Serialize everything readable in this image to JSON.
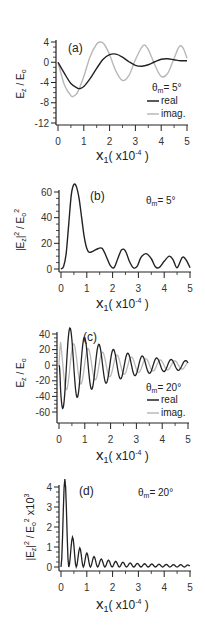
{
  "chart_data": [
    {
      "id": "a",
      "type": "line",
      "panel_label": "(a)",
      "annotation": "θm = 5°",
      "theta_m": "5°",
      "ylabel": "Ez / Eo",
      "xlabel": "x1 ( x10^-4 )",
      "xlim": [
        0,
        5
      ],
      "ylim": [
        -12,
        4
      ],
      "xticks": [
        0,
        1,
        2,
        3,
        4,
        5
      ],
      "yticks": [
        4,
        0,
        -4,
        -8,
        -12
      ],
      "legend": [
        "real",
        "imag."
      ],
      "series": [
        {
          "name": "real",
          "color": "#222222",
          "x": [
            0,
            0.25,
            0.5,
            0.75,
            0.85,
            1.0,
            1.25,
            1.5,
            1.75,
            2.0,
            2.25,
            2.5,
            2.75,
            3.0,
            3.25,
            3.5,
            3.75,
            4.0,
            4.25,
            4.5,
            4.75,
            5.0
          ],
          "y": [
            0,
            -2.2,
            -4.2,
            -5.1,
            -5.2,
            -4.8,
            -3.2,
            -1.2,
            0.6,
            1.5,
            1.6,
            1.0,
            0.1,
            -0.6,
            -0.8,
            -0.5,
            0.1,
            0.6,
            0.7,
            0.5,
            0.3,
            0.3
          ]
        },
        {
          "name": "imag.",
          "color": "#b8b8b8",
          "x": [
            0,
            0.25,
            0.5,
            0.6,
            0.75,
            1.0,
            1.25,
            1.5,
            1.65,
            1.8,
            2.0,
            2.25,
            2.5,
            2.75,
            3.0,
            3.3,
            3.5,
            3.75,
            4.0,
            4.25,
            4.5,
            4.7,
            4.85,
            5.0
          ],
          "y": [
            0,
            -4.5,
            -6.6,
            -6.7,
            -6.0,
            -2.8,
            1.2,
            3.6,
            4.0,
            3.5,
            1.5,
            -1.8,
            -3.6,
            -2.6,
            0.5,
            3.3,
            2.5,
            -0.5,
            -2.8,
            -2.2,
            0.8,
            3.1,
            2.8,
            0.8
          ]
        }
      ]
    },
    {
      "id": "b",
      "type": "line",
      "panel_label": "(b)",
      "annotation": "θm = 5°",
      "theta_m": "5°",
      "ylabel": "|Ez|^2 / Eo^2",
      "xlabel": "x1 ( x10^-4 )",
      "xlim": [
        0,
        5
      ],
      "ylim": [
        0,
        70
      ],
      "xticks": [
        0,
        1,
        2,
        3,
        4,
        5
      ],
      "yticks": [
        0,
        20,
        40,
        60
      ],
      "series": [
        {
          "name": "|Ez|^2/Eo^2",
          "color": "#222222",
          "x": [
            0,
            0.1,
            0.2,
            0.3,
            0.4,
            0.5,
            0.6,
            0.7,
            0.8,
            0.9,
            1.0,
            1.1,
            1.25,
            1.45,
            1.6,
            1.75,
            1.9,
            2.05,
            2.2,
            2.35,
            2.5,
            2.65,
            2.8,
            2.95,
            3.1,
            3.3,
            3.5,
            3.65,
            3.8,
            4.0,
            4.2,
            4.35,
            4.5,
            4.7,
            4.85,
            5.0
          ],
          "y": [
            0,
            2,
            12,
            35,
            58,
            66,
            64,
            55,
            40,
            25,
            16,
            13,
            14,
            16,
            16,
            10,
            3,
            1,
            8,
            15,
            14,
            6,
            1,
            2,
            9,
            12,
            8,
            2,
            1,
            6,
            10,
            7,
            1,
            9,
            7,
            1
          ]
        }
      ]
    },
    {
      "id": "c",
      "type": "line",
      "panel_label": "(c)",
      "annotation": "θm = 20°",
      "theta_m": "20°",
      "ylabel": "Ez / Eo",
      "xlabel": "x1 ( x10^-4 )",
      "xlim": [
        0,
        5
      ],
      "ylim": [
        -70,
        40
      ],
      "xticks": [
        0,
        1,
        2,
        3,
        4,
        5
      ],
      "yticks": [
        40,
        20,
        0,
        -20,
        -40,
        -60
      ],
      "legend": [
        "real",
        "imag."
      ],
      "series": [
        {
          "name": "real",
          "color": "#222222",
          "model": "damped-cosine",
          "amp0": 58,
          "decay": 0.55,
          "period": 0.56,
          "phase_x": 0.15,
          "sign": -1
        },
        {
          "name": "imag.",
          "color": "#b8b8b8",
          "model": "damped-cosine",
          "amp0": 34,
          "decay": 0.5,
          "period": 0.56,
          "phase_x": 0.01,
          "sign": 1
        }
      ]
    },
    {
      "id": "d",
      "type": "line",
      "panel_label": "(d)",
      "annotation": "θm = 20°",
      "theta_m": "20°",
      "ylabel": "|Ez|^2 / Eo^2 x10^3",
      "xlabel": "x1 ( x10^-4 )",
      "xlim": [
        0,
        5
      ],
      "ylim": [
        0,
        4.5
      ],
      "xticks": [
        0,
        1,
        2,
        3,
        4,
        5
      ],
      "yticks": [
        0,
        1,
        2,
        3,
        4
      ],
      "peaks": [
        {
          "x": 0.15,
          "y": 4.4
        },
        {
          "x": 0.45,
          "y": 1.5
        },
        {
          "x": 0.73,
          "y": 0.95
        },
        {
          "x": 1.0,
          "y": 0.7
        },
        {
          "x": 1.28,
          "y": 0.52
        },
        {
          "x": 1.56,
          "y": 0.4
        },
        {
          "x": 1.84,
          "y": 0.34
        },
        {
          "x": 2.12,
          "y": 0.28
        },
        {
          "x": 2.4,
          "y": 0.24
        },
        {
          "x": 2.68,
          "y": 0.2
        },
        {
          "x": 2.96,
          "y": 0.18
        },
        {
          "x": 3.24,
          "y": 0.16
        },
        {
          "x": 3.52,
          "y": 0.15
        },
        {
          "x": 3.8,
          "y": 0.14
        },
        {
          "x": 4.08,
          "y": 0.13
        },
        {
          "x": 4.36,
          "y": 0.12
        },
        {
          "x": 4.64,
          "y": 0.12
        },
        {
          "x": 4.92,
          "y": 0.11
        }
      ],
      "series": [
        {
          "name": "|Ez|^2/Eo^2 x10^3",
          "color": "#222222"
        }
      ]
    }
  ],
  "labels": {
    "a_panel": "(a)",
    "b_panel": "(b)",
    "c_panel": "(c)",
    "d_panel": "(d)",
    "theta": "θ",
    "m_sub": "m",
    "eq5": "= 5°",
    "eq20": "= 20°",
    "real": "real",
    "imag": "imag.",
    "x_main": "x",
    "x_sub": "1",
    "x_unit_open": "( x10",
    "x_unit_exp": "-4",
    "x_unit_close": " )",
    "ez_E": "E",
    "ez_z": "z",
    "ez_slash": " / E",
    "ez_o": "o",
    "abs_open": "|E",
    "abs_z": "z",
    "abs_close": "|",
    "sq": "2",
    "slash_E": " / E",
    "o": "o",
    "x10": " x10",
    "exp3": "3"
  },
  "panels": {
    "a": {
      "x0": 58,
      "x1": 187,
      "ytop": 42,
      "ybot": 123,
      "vtop": 4,
      "vbot": -12,
      "axis_y": 125
    },
    "b": {
      "x0": 61,
      "x1": 190,
      "ytop": 192,
      "ybot": 269,
      "vtop": 60,
      "vbot": 0,
      "axis_y": 272
    },
    "c": {
      "x0": 59,
      "x1": 188,
      "ytop": 334,
      "ybot": 412,
      "vtop": 40,
      "vbot": -60,
      "axis_y": 423
    },
    "d": {
      "x0": 61,
      "x1": 190,
      "ytop": 487,
      "ybot": 567,
      "vtop": 4,
      "vbot": 0,
      "axis_y": 571
    }
  }
}
